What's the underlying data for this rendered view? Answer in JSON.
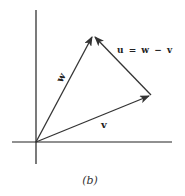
{
  "diagram": {
    "caption": "(b)",
    "equation": "u = w − v",
    "vectors": {
      "w": {
        "label": "w",
        "from": [
          36,
          142
        ],
        "to": [
          93,
          35
        ]
      },
      "v": {
        "label": "v",
        "from": [
          36,
          142
        ],
        "to": [
          151,
          95
        ]
      },
      "u": {
        "label": "u = w − v",
        "from": [
          151,
          95
        ],
        "to": [
          93,
          35
        ]
      }
    },
    "axes": {
      "x": {
        "from": [
          12,
          142
        ],
        "to": [
          172,
          142
        ]
      },
      "y": {
        "from": [
          36,
          10
        ],
        "to": [
          36,
          164
        ]
      }
    },
    "colors": {
      "axis": "#222222",
      "vector": "#333333",
      "background": "#ffffff"
    }
  }
}
